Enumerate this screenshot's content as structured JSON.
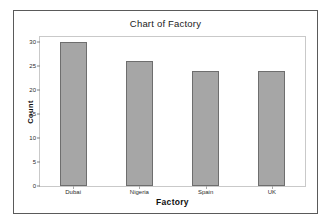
{
  "chart_data": {
    "type": "bar",
    "title": "Chart of Factory",
    "xlabel": "Factory",
    "ylabel": "Count",
    "categories": [
      "Dubai",
      "Nigeria",
      "Spain",
      "UK"
    ],
    "values": [
      30,
      26,
      24,
      24
    ],
    "ylim": [
      0,
      31
    ],
    "yticks": [
      0,
      5,
      10,
      15,
      20,
      25,
      30
    ],
    "ytick_labels": [
      "0",
      "5",
      "10",
      "15",
      "20",
      "25",
      "30"
    ],
    "grid": false,
    "legend": false,
    "bar_color": "#a6a6a6",
    "bar_edge_color": "#6e6e6e",
    "plot_border_color": "#c9c9c9",
    "frame_color": "#5a5a5a",
    "background": "#ffffff"
  }
}
